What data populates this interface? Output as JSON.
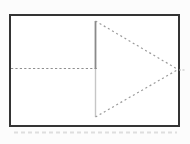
{
  "figure": {
    "canvas": {
      "width": 190,
      "height": 144,
      "background": "#fcfcfc"
    },
    "elements": [
      {
        "name": "frame-shadow",
        "type": "line",
        "x1": 14,
        "y1": 132.5,
        "x2": 177,
        "y2": 132.5,
        "stroke": "#dedede",
        "sw": 2,
        "dash": "4,3"
      },
      {
        "name": "outer-frame",
        "type": "rect",
        "x": 10,
        "y": 15,
        "w": 169,
        "h": 111,
        "stroke": "#343434",
        "sw": 2,
        "fill": "#ffffff"
      },
      {
        "name": "horizontal-midline",
        "type": "line",
        "x1": 11,
        "y1": 68.5,
        "x2": 97,
        "y2": 68.5,
        "stroke": "#8f8f8f",
        "sw": 1,
        "dash": "2.2,2.2"
      },
      {
        "name": "triangle-base-upper",
        "type": "line",
        "x1": 95.5,
        "y1": 21,
        "x2": 95.5,
        "y2": 69,
        "stroke": "#8a8a8a",
        "sw": 1.8,
        "dash": ""
      },
      {
        "name": "triangle-base-lower",
        "type": "line",
        "x1": 95.5,
        "y1": 69,
        "x2": 95.5,
        "y2": 117,
        "stroke": "#c6c6c6",
        "sw": 1.4,
        "dash": ""
      },
      {
        "name": "triangle-upper-edge",
        "type": "line",
        "x1": 95.5,
        "y1": 21,
        "x2": 178,
        "y2": 69.5,
        "stroke": "#9b9b9b",
        "sw": 1.2,
        "dash": "2,2.8"
      },
      {
        "name": "triangle-lower-edge",
        "type": "line",
        "x1": 95.5,
        "y1": 117,
        "x2": 178,
        "y2": 69.5,
        "stroke": "#9b9b9b",
        "sw": 1.2,
        "dash": "2,2.8"
      },
      {
        "name": "right-edge-tick",
        "type": "line",
        "x1": 179,
        "y1": 70,
        "x2": 185,
        "y2": 70,
        "stroke": "#bdbdbd",
        "sw": 1,
        "dash": "2,1.5"
      }
    ]
  }
}
